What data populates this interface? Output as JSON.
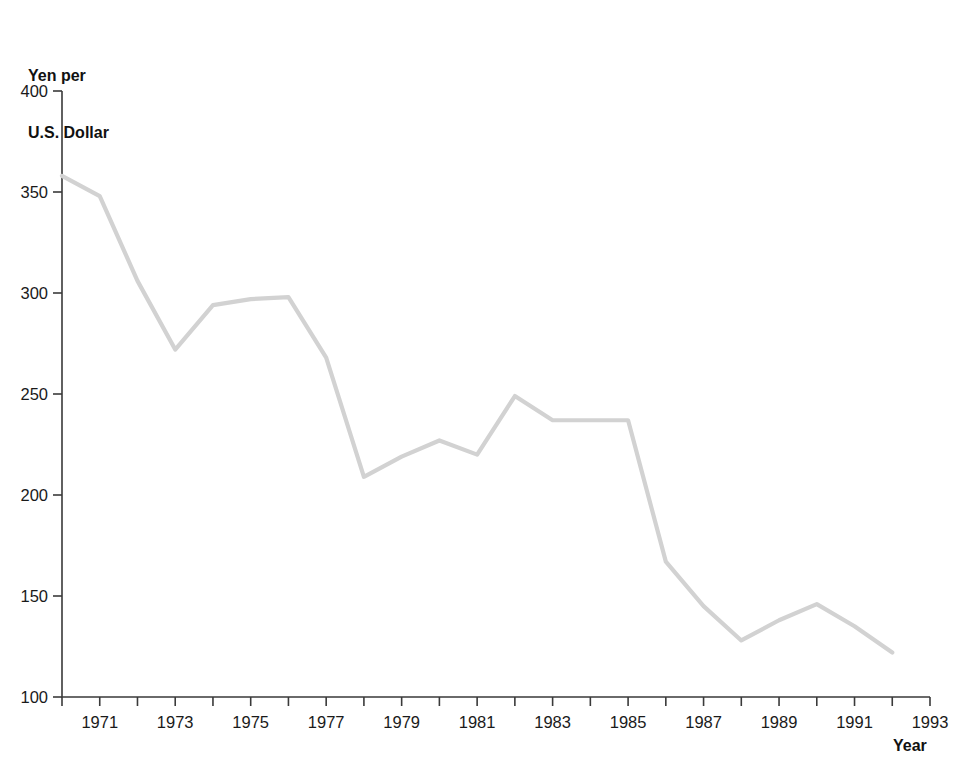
{
  "chart_data": {
    "type": "line",
    "title": "",
    "ylabel": "Yen per\nU.S. Dollar",
    "ylabel_line1": "Yen per",
    "ylabel_line2": "U.S. Dollar",
    "xlabel": "Year",
    "xlim": [
      1970,
      1993
    ],
    "ylim": [
      100,
      400
    ],
    "yticks": [
      100,
      150,
      200,
      250,
      300,
      350,
      400
    ],
    "ytick_labels": [
      "100",
      "150",
      "200",
      "250",
      "300",
      "350",
      "400"
    ],
    "xticks": [
      1970,
      1971,
      1972,
      1973,
      1974,
      1975,
      1976,
      1977,
      1978,
      1979,
      1980,
      1981,
      1982,
      1983,
      1984,
      1985,
      1986,
      1987,
      1988,
      1989,
      1990,
      1991,
      1992,
      1993
    ],
    "xtick_labels_shown": [
      "1971",
      "1973",
      "1975",
      "1977",
      "1979",
      "1981",
      "1983",
      "1985",
      "1987",
      "1989",
      "1991",
      "1993"
    ],
    "grid": false,
    "legend": false,
    "line_color": "#d2d2d2",
    "axis_color": "#3a3a3a",
    "x": [
      1970,
      1971,
      1972,
      1973,
      1974,
      1975,
      1976,
      1977,
      1978,
      1979,
      1980,
      1981,
      1982,
      1983,
      1984,
      1985,
      1986,
      1987,
      1988,
      1989,
      1990,
      1991,
      1992
    ],
    "values": [
      358,
      348,
      306,
      272,
      294,
      297,
      298,
      268,
      209,
      219,
      227,
      220,
      249,
      237,
      237,
      237,
      167,
      145,
      128,
      138,
      146,
      135,
      122
    ],
    "series": [
      {
        "name": "Yen per U.S. Dollar",
        "values": [
          358,
          348,
          306,
          272,
          294,
          297,
          298,
          268,
          209,
          219,
          227,
          220,
          249,
          237,
          237,
          237,
          167,
          145,
          128,
          138,
          146,
          135,
          122
        ]
      }
    ]
  }
}
